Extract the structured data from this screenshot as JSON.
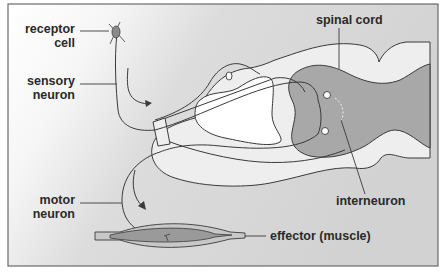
{
  "diagram": {
    "type": "reflex-arc",
    "labels": {
      "receptor_cell": [
        "receptor",
        "cell"
      ],
      "sensory_neuron": [
        "sensory",
        "neuron"
      ],
      "spinal_cord": "spinal cord",
      "interneuron": "interneuron",
      "motor_neuron": [
        "motor",
        "neuron"
      ],
      "effector": "effector (muscle)"
    },
    "colors": {
      "frame_border": "#6a6a6a",
      "background_light": "#ffffff",
      "background_grey": "#d6d6d6",
      "white_matter": "#eeeeee",
      "grey_matter": "#a8a8a8",
      "muscle_outer": "#c8c8c8",
      "muscle_inner": "#9a9a9a",
      "line": "#3a3a3a"
    }
  }
}
